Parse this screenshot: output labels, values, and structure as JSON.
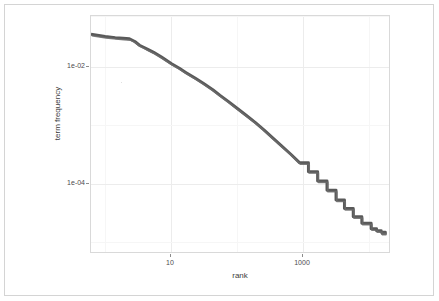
{
  "figure": {
    "background_color": "#ffffff",
    "frame_color": "#d4d4d4",
    "panel_border_color": "#d9d9d9",
    "grid_major_color": "#ececec",
    "grid_minor_color": "#f6f6f6"
  },
  "axes": {
    "x_title": "rank",
    "y_title": "term frequency",
    "x_ticks": [
      {
        "label": "10",
        "value": 10
      },
      {
        "label": "1000",
        "value": 1000
      }
    ],
    "y_ticks": [
      {
        "label": "1e-02",
        "value": 0.01
      },
      {
        "label": "1e-04",
        "value": 0.0001
      }
    ]
  },
  "chart_data": {
    "type": "line",
    "title": "",
    "subtitle": "",
    "xlabel": "rank",
    "ylabel": "term frequency",
    "xscale": "log",
    "yscale": "log",
    "grid": true,
    "legend": "none",
    "xlim": [
      2,
      10000
    ],
    "ylim": [
      3e-06,
      0.05
    ],
    "series_color": "#595959",
    "series_width": 3,
    "series": [
      {
        "name": "term frequency",
        "x": [
          2,
          3,
          4,
          5,
          6,
          7,
          8,
          9,
          10,
          12,
          15,
          20,
          25,
          30,
          40,
          50,
          65,
          80,
          100,
          130,
          170,
          220,
          280,
          360,
          460,
          600,
          780,
          1000,
          1300,
          1700,
          2200,
          2800,
          3600,
          4600,
          6000,
          7000,
          8000,
          9000
        ],
        "y": [
          0.0235,
          0.0215,
          0.0205,
          0.02,
          0.0196,
          0.0175,
          0.015,
          0.0138,
          0.0128,
          0.0112,
          0.0092,
          0.007,
          0.0058,
          0.0049,
          0.0038,
          0.0031,
          0.0024,
          0.0019,
          0.0015,
          0.00112,
          0.00083,
          0.00062,
          0.00046,
          0.00033,
          0.00024,
          0.00017,
          0.000118,
          8.2e-05,
          5.6e-05,
          3.8e-05,
          2.55e-05,
          1.8e-05,
          1.28e-05,
          9.8e-06,
          7.8e-06,
          7.2e-06,
          6.8e-06,
          6.5e-06
        ]
      }
    ]
  }
}
